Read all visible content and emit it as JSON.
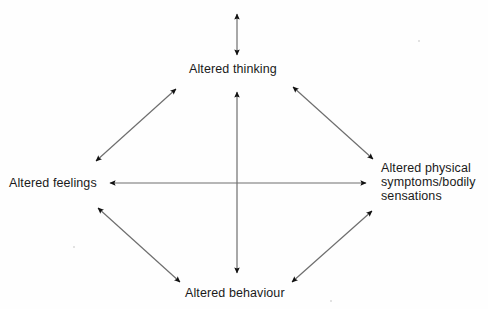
{
  "diagram": {
    "type": "cognitive-behavioural-cycle",
    "title": "",
    "background_color": "#fefefe",
    "line_color": "#6e6e6e",
    "arrowhead_color": "#111111",
    "text_color": "#1a1a1a",
    "nodes": [
      {
        "id": "thinking",
        "label": "Altered thinking",
        "position": "top",
        "lines": [
          "Altered thinking"
        ]
      },
      {
        "id": "feelings",
        "label": "Altered feelings",
        "position": "left",
        "lines": [
          "Altered feelings"
        ]
      },
      {
        "id": "physical",
        "label": "Altered physical symptoms/bodily sensations",
        "position": "right",
        "lines": [
          "Altered physical",
          "symptoms/bodily",
          "sensations"
        ]
      },
      {
        "id": "behaviour",
        "label": "Altered behaviour",
        "position": "bottom",
        "lines": [
          "Altered behaviour"
        ]
      }
    ],
    "connections": [
      {
        "id": "external-to-thinking",
        "from": "external",
        "to": "thinking",
        "style": "double-headed",
        "orientation": "vertical"
      },
      {
        "id": "thinking-to-behaviour",
        "from": "thinking",
        "to": "behaviour",
        "style": "double-headed",
        "orientation": "vertical"
      },
      {
        "id": "feelings-to-physical",
        "from": "feelings",
        "to": "physical",
        "style": "double-headed",
        "orientation": "horizontal"
      },
      {
        "id": "feelings-to-thinking",
        "from": "feelings",
        "to": "thinking",
        "style": "double-headed",
        "orientation": "diagonal-up-right"
      },
      {
        "id": "thinking-to-physical",
        "from": "thinking",
        "to": "physical",
        "style": "double-headed",
        "orientation": "diagonal-down-right"
      },
      {
        "id": "feelings-to-behaviour",
        "from": "feelings",
        "to": "behaviour",
        "style": "double-headed",
        "orientation": "diagonal-down-right"
      },
      {
        "id": "behaviour-to-physical",
        "from": "behaviour",
        "to": "physical",
        "style": "double-headed",
        "orientation": "diagonal-up-right"
      }
    ]
  }
}
